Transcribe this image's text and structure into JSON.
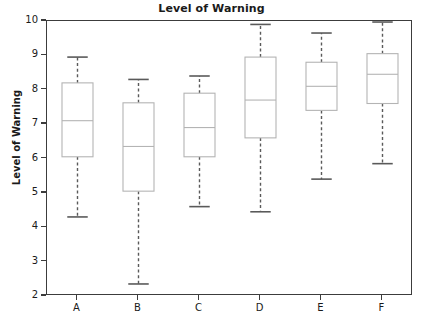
{
  "chart_data": {
    "type": "box",
    "title": "Level of Warning",
    "xlabel": "",
    "ylabel": "Level of Warning",
    "categories": [
      "A",
      "B",
      "C",
      "D",
      "E",
      "F"
    ],
    "ylim": [
      2,
      10
    ],
    "yticks": [
      2,
      3,
      4,
      5,
      6,
      7,
      8,
      9,
      10
    ],
    "ytick_labels": [
      "2",
      "3",
      "4",
      "5",
      "6",
      "7",
      "8",
      "9",
      "10"
    ],
    "grid": false,
    "legend": null,
    "box_style": {
      "box_color": "#b4b4b4",
      "median_color": "#b4b4b4",
      "whisker_color": "#5a5a5a",
      "cap_color": "#5a5a5a",
      "frame_color": "#3c3c3c",
      "fill": "#ffffff",
      "whisker_dash": "dashed"
    },
    "boxes": [
      {
        "label": "A",
        "whisker_low": 4.3,
        "q1": 6.05,
        "median": 7.1,
        "q3": 8.2,
        "whisker_high": 8.95
      },
      {
        "label": "B",
        "whisker_low": 2.35,
        "q1": 5.05,
        "median": 6.35,
        "q3": 7.62,
        "whisker_high": 8.3
      },
      {
        "label": "C",
        "whisker_low": 4.6,
        "q1": 6.05,
        "median": 6.9,
        "q3": 7.9,
        "whisker_high": 8.4
      },
      {
        "label": "D",
        "whisker_low": 4.45,
        "q1": 6.6,
        "median": 7.7,
        "q3": 8.95,
        "whisker_high": 9.9
      },
      {
        "label": "E",
        "whisker_low": 5.4,
        "q1": 7.4,
        "median": 8.1,
        "q3": 8.8,
        "whisker_high": 9.65
      },
      {
        "label": "F",
        "whisker_low": 5.85,
        "q1": 7.6,
        "median": 8.45,
        "q3": 9.05,
        "whisker_high": 9.97
      }
    ]
  }
}
